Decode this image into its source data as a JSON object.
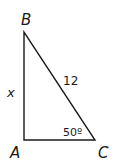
{
  "diagram": {
    "type": "right-triangle",
    "vertices": {
      "A": {
        "label": "A",
        "x": 24,
        "y": 140
      },
      "B": {
        "label": "B",
        "x": 24,
        "y": 32
      },
      "C": {
        "label": "C",
        "x": 95,
        "y": 140
      }
    },
    "side_labels": {
      "AB": "x",
      "BC": "12"
    },
    "angle_labels": {
      "C": "50º"
    },
    "colors": {
      "stroke": "#1a1a1a",
      "background": "#ffffff"
    }
  }
}
